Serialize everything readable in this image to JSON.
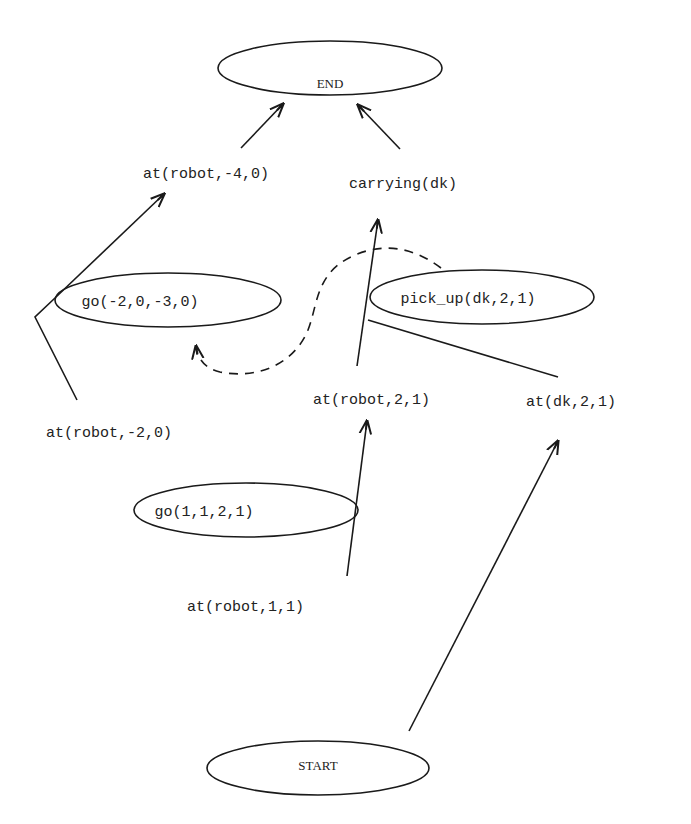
{
  "diagram": {
    "type": "plan-graph",
    "nodes": {
      "end": {
        "label": "END",
        "kind": "terminal"
      },
      "start": {
        "label": "START",
        "kind": "terminal"
      },
      "go1": {
        "label": "go(-2,0,-3,0)",
        "kind": "action"
      },
      "pickup": {
        "label": "pick_up(dk,2,1)",
        "kind": "action"
      },
      "go2": {
        "label": "go(1,1,2,1)",
        "kind": "action"
      }
    },
    "conditions": {
      "at_robot_m4_0": "at(robot,-4,0)",
      "carrying_dk": "carrying(dk)",
      "at_robot_m2_0": "at(robot,-2,0)",
      "at_robot_2_1": "at(robot,2,1)",
      "at_dk_2_1": "at(dk,2,1)",
      "at_robot_1_1": "at(robot,1,1)"
    },
    "edges": [
      {
        "from": "at(robot,-4,0)",
        "to": "END",
        "style": "solid"
      },
      {
        "from": "carrying(dk)",
        "to": "END",
        "style": "solid"
      },
      {
        "from": "at(robot,-2,0)",
        "via": "go(-2,0,-3,0)",
        "to": "at(robot,-4,0)",
        "style": "solid"
      },
      {
        "from": "at(robot,2,1)",
        "via": "pick_up(dk,2,1)",
        "to": "carrying(dk)",
        "style": "solid"
      },
      {
        "from": "at(dk,2,1)",
        "via": "pick_up(dk,2,1)",
        "to": "carrying(dk)",
        "style": "solid"
      },
      {
        "from": "pick_up(dk,2,1)",
        "to": "go(-2,0,-3,0)",
        "style": "dashed",
        "meaning": "ordering"
      },
      {
        "from": "at(robot,1,1)",
        "via": "go(1,1,2,1)",
        "to": "at(robot,2,1)",
        "style": "solid"
      },
      {
        "from": "START",
        "to": "at(dk,2,1)",
        "style": "solid"
      }
    ]
  }
}
